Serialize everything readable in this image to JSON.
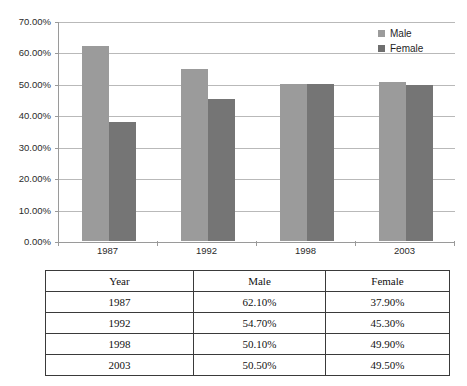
{
  "chart_data": {
    "type": "bar",
    "title": "",
    "xlabel": "",
    "ylabel": "",
    "categories": [
      "1987",
      "1992",
      "1998",
      "2003"
    ],
    "series": [
      {
        "name": "Male",
        "color": "#9b9b9b",
        "values": [
          62.1,
          54.7,
          50.1,
          50.5
        ]
      },
      {
        "name": "Female",
        "color": "#757575",
        "values": [
          37.9,
          45.3,
          49.9,
          49.5
        ]
      }
    ],
    "ylim": [
      0,
      70
    ],
    "ytick_step": 10,
    "ytick_labels": [
      "0.00%",
      "10.00%",
      "20.00%",
      "30.00%",
      "40.00%",
      "50.00%",
      "60.00%",
      "70.00%"
    ],
    "grid": true,
    "legend_position": "top-right",
    "value_format": "percent"
  },
  "legend": {
    "items": [
      {
        "label": "Male"
      },
      {
        "label": "Female"
      }
    ]
  },
  "table": {
    "headers": [
      "Year",
      "Male",
      "Female"
    ],
    "rows": [
      [
        "1987",
        "62.10%",
        "37.90%"
      ],
      [
        "1992",
        "54.70%",
        "45.30%"
      ],
      [
        "1998",
        "50.10%",
        "49.90%"
      ],
      [
        "2003",
        "50.50%",
        "49.50%"
      ]
    ]
  }
}
